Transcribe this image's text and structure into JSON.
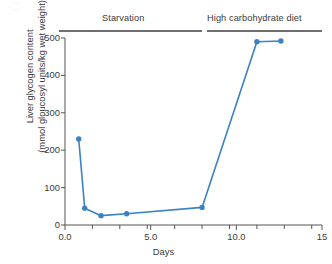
{
  "chart_data": {
    "type": "line",
    "title": "",
    "xlabel": "Days",
    "ylabel_line1": "Liver glycogen content",
    "ylabel_line2": "(mmol gloucosyl units/kg wet weight)",
    "xlim": [
      0,
      15
    ],
    "ylim": [
      0,
      500
    ],
    "grid": false,
    "legend": "none",
    "series_color": "#3b82c4",
    "marker": "circle",
    "x_ticks": [
      {
        "value": 0,
        "label": "0.0"
      },
      {
        "value": 5,
        "label": "5.0"
      },
      {
        "value": 10,
        "label": "10.0"
      },
      {
        "value": 15,
        "label": "15"
      }
    ],
    "x_minor_ticks": [
      1.6,
      3.2,
      4.8,
      6.4,
      8.0,
      9.6,
      11.2,
      12.8,
      14.4
    ],
    "y_ticks": [
      {
        "value": 0,
        "label": "0"
      },
      {
        "value": 100,
        "label": "100"
      },
      {
        "value": 200,
        "label": "200"
      },
      {
        "value": 300,
        "label": "300"
      },
      {
        "value": 400,
        "label": "400"
      },
      {
        "value": 500,
        "label": "500"
      }
    ],
    "series": [
      {
        "name": "Liver glycogen content",
        "x": [
          0.8,
          1.15,
          2.1,
          3.6,
          8.0,
          11.2,
          12.6
        ],
        "values": [
          230,
          45,
          25,
          30,
          47,
          490,
          492
        ]
      }
    ],
    "annotations": [
      {
        "id": "starvation",
        "label": "Starvation",
        "bar_x_start": 0.0,
        "bar_x_end": 8.0,
        "position": "top"
      },
      {
        "id": "high-carbohydrate-diet",
        "label": "High carbohydrate diet",
        "bar_x_start": 8.3,
        "bar_x_end": 15.0,
        "position": "top"
      }
    ]
  },
  "axis": {
    "x_title": "Days",
    "y_title_line1": "Liver glycogen content",
    "y_title_line2": "(mmol gloucosyl units/kg wet weight)"
  },
  "periods": {
    "starvation": "Starvation",
    "high_carb": "High carbohydrate diet"
  },
  "colors": {
    "series": "#3b82c4",
    "axis": "#555555",
    "period_bar": "#6f6f6f",
    "text": "#3a3a3a",
    "background": "#ffffff"
  }
}
